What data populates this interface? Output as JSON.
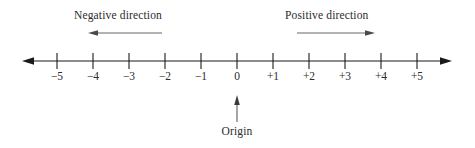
{
  "figure": {
    "type": "number-line-diagram",
    "width": 475,
    "height": 148,
    "background": "#ffffff",
    "line_color": "#1a1a1a",
    "text_color": "#2b2b2b",
    "arrow_color": "#3a3a3a"
  },
  "annotations": {
    "negative_direction": "Negative direction",
    "positive_direction": "Positive direction",
    "origin": "Origin"
  },
  "axis": {
    "labels": [
      "−5",
      "−4",
      "−3",
      "−2",
      "−1",
      "0",
      "+1",
      "+2",
      "+3",
      "+4",
      "+5"
    ],
    "values": [
      -5,
      -4,
      -3,
      -2,
      -1,
      0,
      1,
      2,
      3,
      4,
      5
    ],
    "tick_x": [
      57,
      93,
      129,
      165,
      201,
      237,
      273,
      309,
      345,
      381,
      417
    ],
    "line_y": 61,
    "tick_top": 53,
    "tick_bottom": 69,
    "left_arrow_x": 22,
    "right_arrow_x": 452,
    "origin_value": 0,
    "origin_x": 237
  },
  "direction_arrows": {
    "negative": {
      "x_start": 162,
      "x_end": 88,
      "y": 33,
      "points": "left"
    },
    "positive": {
      "x_start": 297,
      "x_end": 375,
      "y": 33,
      "points": "right"
    }
  },
  "origin_arrow": {
    "x": 237,
    "y_start": 122,
    "y_end": 95,
    "points": "up"
  }
}
